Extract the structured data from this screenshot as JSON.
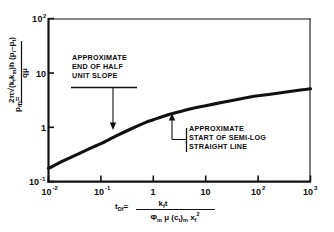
{
  "chart_data": {
    "type": "line",
    "title": "",
    "xlabel": "t_Df = k_f t / (phi_m mu (c_t)_m x_f^2)",
    "ylabel": "p_fD = 2 pi sqrt(k_f k_m) h (p_i - p_f) / (q mu)",
    "xscale": "log",
    "yscale": "log",
    "xlim": [
      0.01,
      1000
    ],
    "ylim": [
      0.1,
      100
    ],
    "grid": false,
    "legend": "none",
    "x_ticks": [
      "10-2",
      "10-1",
      "1",
      "10",
      "102",
      "103"
    ],
    "x_tick_values": [
      0.01,
      0.1,
      1,
      10,
      100,
      1000
    ],
    "y_ticks": [
      "10-1",
      "1",
      "10",
      "102"
    ],
    "y_tick_values": [
      0.1,
      1,
      10,
      100
    ],
    "series": [
      {
        "name": "dimensionless fracture pressure",
        "x": [
          0.01,
          0.02,
          0.04,
          0.07,
          0.1,
          0.2,
          0.4,
          0.7,
          1,
          2,
          4,
          7,
          10,
          20,
          40,
          70,
          100,
          200,
          400,
          700,
          1000
        ],
        "y": [
          0.175,
          0.245,
          0.335,
          0.43,
          0.5,
          0.7,
          0.96,
          1.22,
          1.38,
          1.72,
          2.05,
          2.33,
          2.5,
          2.85,
          3.25,
          3.6,
          3.8,
          4.15,
          4.55,
          4.9,
          5.1
        ]
      }
    ],
    "annotations": [
      {
        "name": "end-of-half-unit-slope",
        "lines": [
          "APPROXIMATE",
          "END OF HALF",
          "UNIT SLOPE"
        ],
        "target_x": 0.17,
        "target_y": 0.66
      },
      {
        "name": "start-of-semilog-straight-line",
        "lines": [
          "APPROXIMATE",
          "START OF SEMI-LOG",
          "STRAIGHT LINE"
        ],
        "target_x": 2.3,
        "target_y": 1.8
      }
    ]
  },
  "axis": {
    "y_label_parts": {
      "lead": "p",
      "lead_sub": "fD",
      "equals": "=",
      "num_coef": "2",
      "num_pi": "π",
      "num_radical": "k",
      "num_k1_sub": "f",
      "num_km": "k",
      "num_km_sub": "m",
      "num_h": "h",
      "num_paren": "(p",
      "num_pi_sub": "i",
      "num_minus": "–p",
      "num_pf_sub": "f",
      "num_close": ")",
      "den": "q",
      "den_mu": "μ"
    },
    "x_label_parts": {
      "lead": "t",
      "lead_sub": "Df",
      "equals": "=",
      "num_k": "k",
      "num_k_sub": "f",
      "num_t": "t",
      "den_phi": "Φ",
      "den_phi_sub": "m",
      "den_mu": "μ",
      "den_c": "(c",
      "den_c_sub": "t",
      "den_c_close": ")",
      "den_c_msub": "m",
      "den_x": "x",
      "den_x_sub": "f",
      "den_x_sup": "2"
    }
  },
  "colors": {
    "curve": "#111111",
    "frame": "#111111",
    "text": "#0d0d0d",
    "background": "#ffffff"
  }
}
